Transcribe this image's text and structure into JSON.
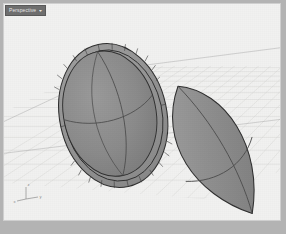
{
  "window": {
    "frame_color": "#b3b3b3",
    "viewport_background": "#f0f0ef"
  },
  "viewport": {
    "title": "Perspective",
    "title_arrow": "▾",
    "title_bg_color": "#6f6f6f",
    "title_text_color": "#e8e8e8",
    "shading_mode": "Shaded",
    "projection": "Perspective"
  },
  "axis_gizmo": {
    "name": "world-axes",
    "x_label": "x",
    "y_label": "y",
    "z_label": "z",
    "color": "#8e8e8e"
  },
  "grid": {
    "name": "construction-plane-grid",
    "line_color": "#bfbfbf",
    "major_line_color": "#a8a8a8",
    "visible": true
  },
  "objects": [
    {
      "id": "object-1",
      "name": "ellipsoid-shell-left",
      "type": "ellipsoid-shell",
      "label": "Ellipsoid (shelled)",
      "fill_color": "#8a8a8a",
      "rim_fill_color": "#9b9b9b",
      "edge_color": "#2e2e2e",
      "isocurve_color": "#4a4a4a",
      "center_x": 110,
      "center_y": 112,
      "radius_x": 54,
      "radius_y": 73,
      "rotation_deg": -12,
      "rim_thickness": 7,
      "rim_segments": 24
    },
    {
      "id": "object-2",
      "name": "lens-solid-right",
      "type": "lens-solid",
      "label": "Lens solid",
      "fill_color": "#8e8e8e",
      "edge_color": "#2e2e2e",
      "isocurve_color": "#4a4a4a",
      "center_x": 210,
      "center_y": 148,
      "radius_x": 47,
      "radius_y": 74,
      "rotation_deg": -28
    }
  ],
  "colors": {
    "object_gray": "#8a8a8a",
    "edge_dark": "#2e2e2e",
    "background_light": "#f0f0ef",
    "frame_gray": "#b3b3b3",
    "grid_gray": "#bfbfbf"
  }
}
